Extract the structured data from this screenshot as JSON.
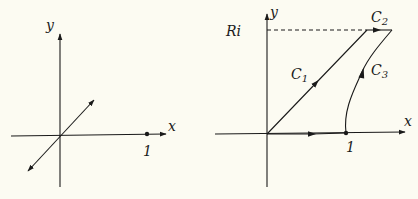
{
  "left_diagram": {
    "axis_x_label": "x",
    "axis_y_label": "y",
    "point_label": "1"
  },
  "right_diagram": {
    "axis_x_label": "x",
    "axis_y_label": "y",
    "point_label": "1",
    "height_label": "Ri",
    "contours": [
      {
        "name": "C1",
        "label_main": "C",
        "label_sub": "1"
      },
      {
        "name": "C2",
        "label_main": "C",
        "label_sub": "2"
      },
      {
        "name": "C3",
        "label_main": "C",
        "label_sub": "3"
      }
    ]
  },
  "colors": {
    "background": "#fcfbf2",
    "ink": "#1a1a1a"
  }
}
